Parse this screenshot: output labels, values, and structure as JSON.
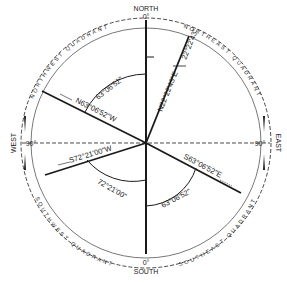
{
  "cardinals": {
    "north": {
      "name": "NORTH",
      "deg": "0°"
    },
    "south": {
      "name": "SOUTH",
      "deg": "0°"
    },
    "east": {
      "name": "EAST",
      "deg": "90°"
    },
    "west": {
      "name": "WEST",
      "deg": "90°"
    }
  },
  "quadrants": {
    "ne": "NORTHEAST QUADRANT",
    "nw": "NORTHWEST QUADRANT",
    "se": "SOUTHEAST QUADRANT",
    "sw": "SOUTHWEST QUADRANT"
  },
  "bearings": [
    {
      "id": "ne",
      "label": "N22°22'43\"E",
      "angle_label": "22°22'43\""
    },
    {
      "id": "nw",
      "label": "N63°06'52\"W",
      "angle_label": "63°06'52\""
    },
    {
      "id": "sw",
      "label": "S72°21'00\"W",
      "angle_label": "72°21'00\""
    },
    {
      "id": "se",
      "label": "S63°06'52\"E",
      "angle_label": "63°06'52\""
    }
  ],
  "colors": {
    "ink": "#1a1a1a",
    "paper": "#ffffff",
    "thin": "#555555"
  }
}
